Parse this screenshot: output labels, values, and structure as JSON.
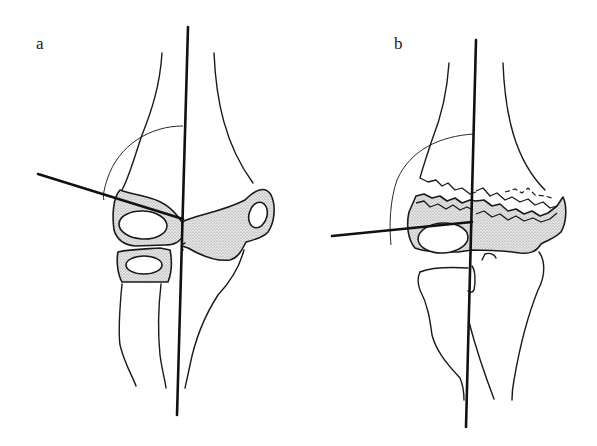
{
  "figure": {
    "panels": [
      {
        "id": "a",
        "label": "a",
        "description": "Normal elbow: humeral axis line and capitellar line intersecting at the joint"
      },
      {
        "id": "b",
        "label": "b",
        "description": "Fractured distal humerus with displaced fragments; lines intersect at the joint"
      }
    ],
    "colors": {
      "line": "#111111",
      "stipple": "#c8c8c8",
      "background": "#ffffff"
    }
  }
}
